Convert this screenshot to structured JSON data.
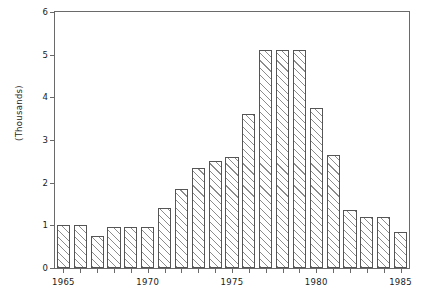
{
  "chart_data": {
    "type": "bar",
    "title": "",
    "subtitle": "",
    "xlabel": "",
    "ylabel": "(Thousands)",
    "xlim": [
      1964.5,
      1985.5
    ],
    "ylim": [
      0,
      6
    ],
    "grid": false,
    "legend": null,
    "y_ticks": [
      0,
      1,
      2,
      3,
      4,
      5,
      6
    ],
    "y_tick_labels": [
      "0",
      "1",
      "2",
      "3",
      "4",
      "5",
      "6"
    ],
    "x_ticks": [
      1965,
      1966,
      1967,
      1968,
      1969,
      1970,
      1971,
      1972,
      1973,
      1974,
      1975,
      1976,
      1977,
      1978,
      1979,
      1980,
      1981,
      1982,
      1983,
      1984,
      1985
    ],
    "x_tick_labels_shown": [
      "1965",
      "1970",
      "1975",
      "1980",
      "1985"
    ],
    "bar_style": "diagonal-hatch",
    "categories": [
      "1965",
      "1966",
      "1967",
      "1968",
      "1969",
      "1970",
      "1971",
      "1972",
      "1973",
      "1974",
      "1975",
      "1976",
      "1977",
      "1978",
      "1979",
      "1980",
      "1981",
      "1982",
      "1983",
      "1984",
      "1985"
    ],
    "values": [
      1.0,
      1.0,
      0.75,
      0.95,
      0.95,
      0.95,
      1.4,
      1.85,
      2.35,
      2.5,
      2.6,
      3.6,
      5.1,
      5.1,
      5.1,
      3.75,
      2.65,
      1.35,
      1.2,
      1.2,
      0.85
    ],
    "units": "thousands"
  },
  "axis": {
    "y_title": "(Thousands)"
  }
}
